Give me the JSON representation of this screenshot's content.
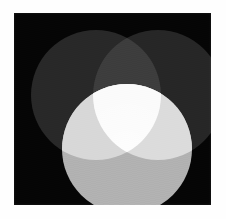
{
  "figure": {
    "background_color": "#fefefe",
    "canvas_color": "#050505",
    "canvas": {
      "x": 14,
      "y": 13,
      "width": 197,
      "height": 192
    }
  },
  "chart_data": {
    "type": "venn",
    "subtitle": "",
    "xlabel": "",
    "ylabel": "",
    "grid": false,
    "legend_position": "none",
    "background": "#050505",
    "set_count": 3,
    "sets": [
      {
        "name": "top-left-circle",
        "label": "",
        "cx": 82,
        "cy": 82,
        "r": 65,
        "fill": "#282828",
        "opacity": 1.0
      },
      {
        "name": "top-right-circle",
        "label": "",
        "cx": 144,
        "cy": 82,
        "r": 65,
        "fill": "#262626",
        "opacity": 1.0
      },
      {
        "name": "bottom-circle",
        "label": "",
        "cx": 113,
        "cy": 136,
        "r": 65,
        "fill": "#b2b2b2",
        "opacity": 1.0
      }
    ],
    "intersections": [
      {
        "name": "top-left-and-top-right",
        "sets": [
          "top-left-circle",
          "top-right-circle"
        ],
        "fill": "#3d3d3d"
      },
      {
        "name": "top-left-and-bottom",
        "sets": [
          "top-left-circle",
          "bottom-circle"
        ],
        "fill": "#d8d8d8"
      },
      {
        "name": "top-right-and-bottom",
        "sets": [
          "top-right-circle",
          "bottom-circle"
        ],
        "fill": "#dcdcdc"
      },
      {
        "name": "all-three",
        "sets": [
          "top-left-circle",
          "top-right-circle",
          "bottom-circle"
        ],
        "fill": "#fbfbfb"
      }
    ],
    "annotations": [],
    "tick_labels": [],
    "values": [],
    "categories": []
  }
}
